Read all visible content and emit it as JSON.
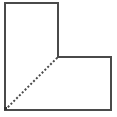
{
  "diagram": {
    "type": "geometric-figure",
    "shape": "L-shaped polygon",
    "stroke_color": "#4a4a4a",
    "background": "#ffffff",
    "outline_points": [
      [
        5,
        3
      ],
      [
        58,
        3
      ],
      [
        58,
        57
      ],
      [
        111,
        57
      ],
      [
        111,
        110
      ],
      [
        5,
        110
      ]
    ],
    "dashed_segment": {
      "from": [
        5,
        110
      ],
      "to": [
        58,
        57
      ]
    },
    "vertex_marker": {
      "at": [
        6,
        109
      ]
    }
  }
}
